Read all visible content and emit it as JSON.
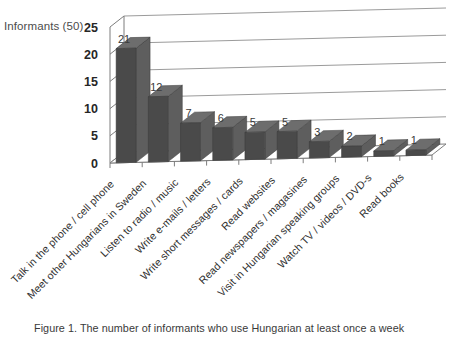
{
  "chart_data": {
    "type": "bar",
    "title": "",
    "ylabel": "Informants (50)",
    "xlabel": "",
    "ylim": [
      0,
      25
    ],
    "yticks": [
      0,
      5,
      10,
      15,
      20,
      25
    ],
    "grid": true,
    "legend": false,
    "style": "3d-column",
    "categories": [
      "Talk in the phone / cell phone",
      "Meet other Hungarians  in Sweden",
      "Listen to radio / music",
      "Write e-mails / letters",
      "Write short messages / cards",
      "Read websites",
      "Read newspapers / magasines",
      "Visit in Hungarian speaking  groups",
      "Watch TV / videos / DVD-s",
      "Read books"
    ],
    "values": [
      21,
      12,
      7,
      6,
      5,
      5,
      3,
      2,
      1,
      1
    ],
    "value_labels": [
      "21",
      "12",
      "7",
      "6",
      "5",
      "5",
      "3",
      "2",
      "1",
      "1"
    ],
    "ytick_labels": [
      "0",
      "5",
      "10",
      "15",
      "20",
      "25"
    ],
    "colors": {
      "bar_front": "#4a4a4a",
      "bar_top": "#6d6d6d",
      "bar_side": "#5e5e5e",
      "gridline": "#9b9b9b",
      "axis": "#7d7d7d",
      "background": "#ffffff",
      "text": "#2b2b2b"
    }
  },
  "caption": {
    "text": "Figure 1.  The number of informants who use Hungarian at least once a week"
  }
}
